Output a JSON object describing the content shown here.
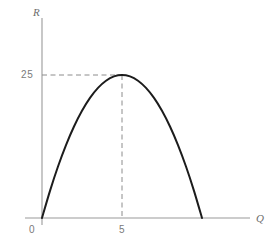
{
  "chart_data": {
    "type": "line",
    "title": "",
    "subtitle": "",
    "xlabel": "Q",
    "ylabel": "R",
    "grid": false,
    "legend": null,
    "xlim": [
      0,
      14.1
    ],
    "ylim": [
      0,
      36.5
    ],
    "xticks": [
      {
        "value": 0,
        "label": "0"
      },
      {
        "value": 5,
        "label": "5"
      }
    ],
    "yticks": [
      {
        "value": 25,
        "label": "25"
      }
    ],
    "series": [
      {
        "name": "R(Q)",
        "color": "#1c1c1c",
        "x": [
          0,
          0.5,
          1,
          1.5,
          2,
          2.5,
          3,
          3.5,
          4,
          4.5,
          5,
          5.5,
          6,
          6.5,
          7,
          7.5,
          8,
          8.5,
          9,
          9.5,
          10
        ],
        "y": [
          0,
          4.75,
          9,
          12.75,
          16,
          18.75,
          21,
          22.75,
          24,
          24.75,
          25,
          24.75,
          24,
          22.75,
          21,
          18.75,
          16,
          12.75,
          9,
          4.75,
          0
        ]
      }
    ],
    "annotations": [
      {
        "kind": "dashed-guide",
        "orientation": "horizontal",
        "from": [
          0,
          25
        ],
        "to": [
          5,
          25
        ],
        "color": "#8c8c8c"
      },
      {
        "kind": "dashed-guide",
        "orientation": "vertical",
        "from": [
          5,
          25
        ],
        "to": [
          5,
          0
        ],
        "color": "#8c8c8c"
      }
    ],
    "maximum_point": {
      "x": 5,
      "y": 25
    },
    "roots": [
      0,
      10
    ],
    "axis_color": "#9a9a9a",
    "background_color": "#ffffff"
  },
  "axes": {
    "y_label": "R",
    "x_label": "Q"
  },
  "ticks": {
    "y_25": "25",
    "x_5": "5",
    "origin_0": "0"
  }
}
